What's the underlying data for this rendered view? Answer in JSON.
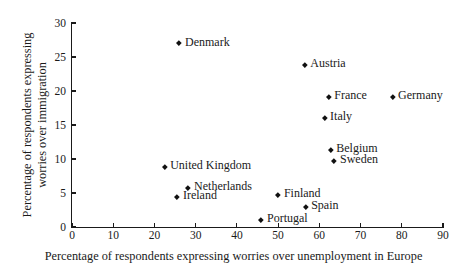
{
  "chart_data": {
    "type": "scatter",
    "title": "",
    "xlabel": "Percentage of respondents expressing worries over unemployment in Europe",
    "ylabel_line1": "Percentage of respondents expressing",
    "ylabel_line2": "worries over immigration",
    "xlim": [
      0,
      90
    ],
    "ylim": [
      0,
      30
    ],
    "xticks": [
      0,
      10,
      20,
      30,
      40,
      50,
      60,
      70,
      80,
      90
    ],
    "yticks": [
      0,
      5,
      10,
      15,
      20,
      25,
      30
    ],
    "grid": false,
    "legend": "none",
    "marker": "diamond",
    "marker_color": "#111111",
    "points": [
      {
        "label": "Denmark",
        "x": 26.2,
        "y": 26.9
      },
      {
        "label": "Austria",
        "x": 56.6,
        "y": 23.7
      },
      {
        "label": "France",
        "x": 62.4,
        "y": 19.0
      },
      {
        "label": "Germany",
        "x": 77.9,
        "y": 19.1
      },
      {
        "label": "Italy",
        "x": 61.4,
        "y": 16.0
      },
      {
        "label": "Belgium",
        "x": 62.9,
        "y": 11.3
      },
      {
        "label": "Sweden",
        "x": 63.8,
        "y": 9.6
      },
      {
        "label": "United Kingdom",
        "x": 22.6,
        "y": 8.7
      },
      {
        "label": "Netherlands",
        "x": 28.4,
        "y": 5.6
      },
      {
        "label": "Ireland",
        "x": 25.7,
        "y": 4.3
      },
      {
        "label": "Finland",
        "x": 50.2,
        "y": 4.6
      },
      {
        "label": "Spain",
        "x": 56.8,
        "y": 2.9
      },
      {
        "label": "Portugal",
        "x": 46.1,
        "y": 1.0
      }
    ]
  }
}
